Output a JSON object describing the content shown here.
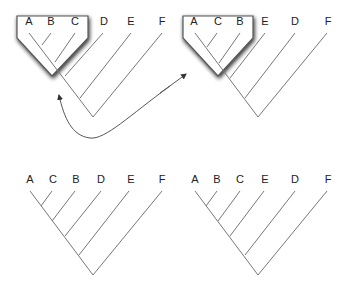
{
  "figure": {
    "colors": {
      "branch": "#777777",
      "label": "#222222",
      "box_stroke": "#555555",
      "shadow": "#333333",
      "arrow": "#555555"
    }
  },
  "trees": [
    {
      "id": "top-left",
      "labels": [
        "A",
        "B",
        "C",
        "D",
        "E",
        "F"
      ],
      "highlighted_clade": [
        "A",
        "B",
        "C"
      ]
    },
    {
      "id": "top-right",
      "labels": [
        "A",
        "C",
        "B",
        "E",
        "D",
        "F"
      ],
      "highlighted_clade": [
        "A",
        "C",
        "B"
      ]
    },
    {
      "id": "bottom-left",
      "labels": [
        "A",
        "C",
        "B",
        "D",
        "E",
        "F"
      ]
    },
    {
      "id": "bottom-right",
      "labels": [
        "A",
        "B",
        "C",
        "E",
        "D",
        "F"
      ]
    }
  ],
  "arrow": {
    "type": "double-headed curved",
    "connects": [
      "top-left",
      "top-right"
    ]
  }
}
